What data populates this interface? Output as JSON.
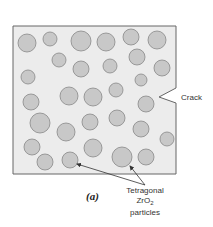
{
  "figure": {
    "label": "(a)",
    "crack_label": "Crack",
    "particle_label": {
      "line1": "Tetragonal",
      "line2_main": "ZrO",
      "line2_sub": "2",
      "line3": "particles"
    }
  },
  "colors": {
    "matrix_fill": "#ececec",
    "matrix_stroke": "#666666",
    "particle_fill": "#c8c8c8",
    "particle_stroke": "#888888",
    "text": "#333333"
  },
  "matrix": {
    "x": 13,
    "y": 26,
    "width": 163,
    "height": 148
  },
  "crack": {
    "tip_x": 159,
    "tip_y": 97,
    "top_y": 88,
    "bottom_y": 103
  },
  "particles": [
    {
      "cx": 27,
      "cy": 43,
      "r": 9
    },
    {
      "cx": 50,
      "cy": 39,
      "r": 7
    },
    {
      "cx": 81,
      "cy": 41,
      "r": 10
    },
    {
      "cx": 106,
      "cy": 42,
      "r": 9
    },
    {
      "cx": 131,
      "cy": 37,
      "r": 8
    },
    {
      "cx": 157,
      "cy": 40,
      "r": 9
    },
    {
      "cx": 59,
      "cy": 60,
      "r": 7
    },
    {
      "cx": 81,
      "cy": 69,
      "r": 8
    },
    {
      "cx": 110,
      "cy": 66,
      "r": 7
    },
    {
      "cx": 137,
      "cy": 57,
      "r": 8
    },
    {
      "cx": 162,
      "cy": 68,
      "r": 8
    },
    {
      "cx": 28,
      "cy": 77,
      "r": 7
    },
    {
      "cx": 141,
      "cy": 80,
      "r": 6
    },
    {
      "cx": 69,
      "cy": 96,
      "r": 9
    },
    {
      "cx": 93,
      "cy": 97,
      "r": 9
    },
    {
      "cx": 116,
      "cy": 90,
      "r": 7
    },
    {
      "cx": 31,
      "cy": 102,
      "r": 8
    },
    {
      "cx": 146,
      "cy": 104,
      "r": 8
    },
    {
      "cx": 40,
      "cy": 123,
      "r": 10
    },
    {
      "cx": 66,
      "cy": 132,
      "r": 9
    },
    {
      "cx": 90,
      "cy": 122,
      "r": 8
    },
    {
      "cx": 117,
      "cy": 118,
      "r": 8
    },
    {
      "cx": 141,
      "cy": 129,
      "r": 8
    },
    {
      "cx": 167,
      "cy": 139,
      "r": 7
    },
    {
      "cx": 32,
      "cy": 147,
      "r": 8
    },
    {
      "cx": 93,
      "cy": 148,
      "r": 9
    },
    {
      "cx": 122,
      "cy": 157,
      "r": 10
    },
    {
      "cx": 146,
      "cy": 157,
      "r": 8
    },
    {
      "cx": 45,
      "cy": 162,
      "r": 8
    },
    {
      "cx": 70,
      "cy": 160,
      "r": 8
    }
  ],
  "arrows": [
    {
      "from_x": 145,
      "from_y": 185,
      "to_x": 77,
      "to_y": 164
    },
    {
      "from_x": 145,
      "from_y": 185,
      "to_x": 130,
      "to_y": 166
    }
  ]
}
